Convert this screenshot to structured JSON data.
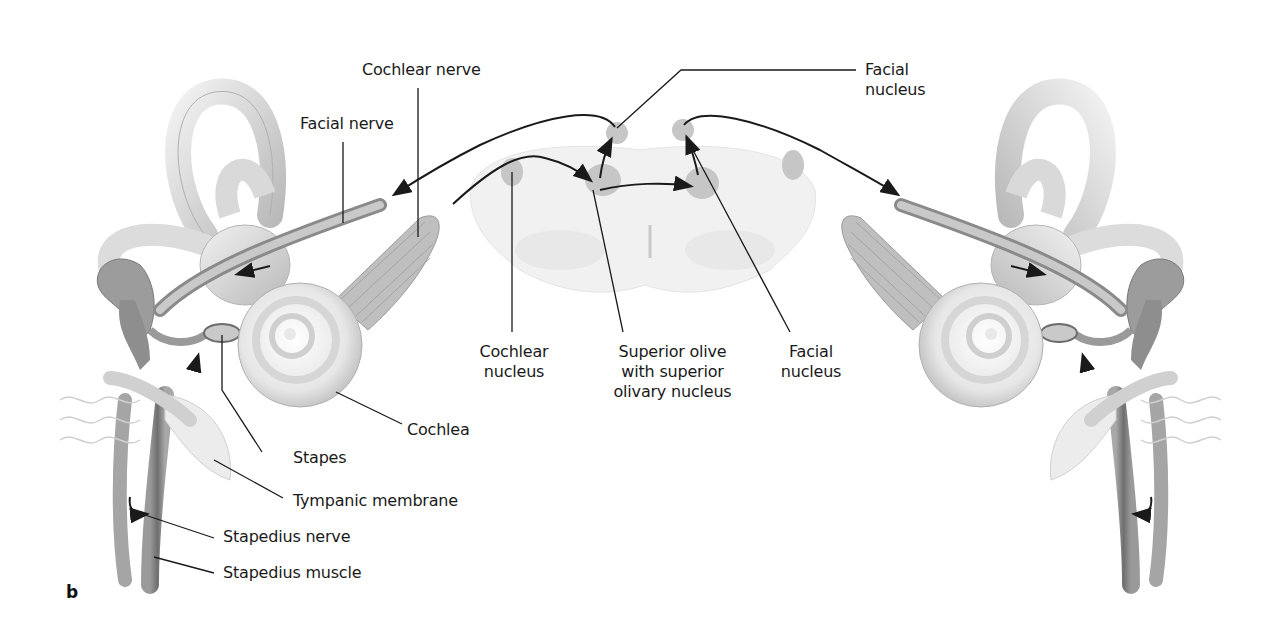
{
  "figure": {
    "panel_label": "b",
    "labels": {
      "cochlear_nerve": "Cochlear nerve",
      "facial_nerve": "Facial nerve",
      "facial_nucleus_top": "Facial\nnucleus",
      "cochlear_nucleus": "Cochlear\nnucleus",
      "superior_olive": "Superior olive\nwith superior\nolivary nucleus",
      "facial_nucleus_bottom": "Facial\nnucleus",
      "cochlea": "Cochlea",
      "stapes": "Stapes",
      "tympanic_membrane": "Tympanic membrane",
      "stapedius_nerve": "Stapedius nerve",
      "stapedius_muscle": "Stapedius muscle"
    },
    "colors": {
      "line": "#1a1a1a",
      "nucleus": "#c8c8c8",
      "brainstem": "#ececec",
      "anatomy": "#d4d4d4"
    }
  }
}
